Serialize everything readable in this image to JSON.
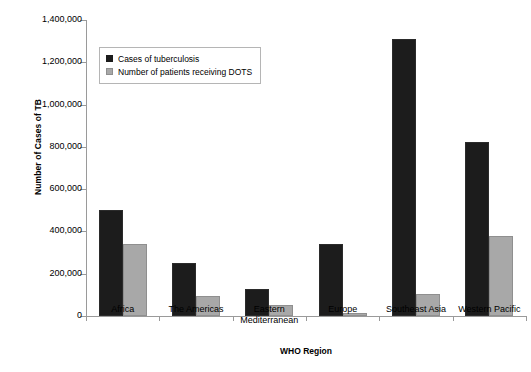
{
  "chart_data": {
    "type": "bar",
    "title": "",
    "xlabel": "WHO Region",
    "ylabel": "Number of Cases of TB",
    "ylim": [
      0,
      1400000
    ],
    "ytick_labels": [
      "1,400,000",
      "1,200,000",
      "1,000,000",
      "800,000",
      "600,000",
      "400,000",
      "200,000",
      "0"
    ],
    "ytick_values": [
      1400000,
      1200000,
      1000000,
      800000,
      600000,
      400000,
      200000,
      0
    ],
    "grid": false,
    "legend_position": "upper-left-inside",
    "categories": [
      "Africa",
      "The Americas",
      "Eastern Mediterranean",
      "Europe",
      "Southeast Asia",
      "Western Pacific"
    ],
    "series": [
      {
        "name": "Cases of tuberculosis",
        "color": "#1c1c1c",
        "values": [
          500000,
          250000,
          130000,
          340000,
          1310000,
          825000
        ]
      },
      {
        "name": "Number of patients receiving DOTS",
        "color": "#a8a8a8",
        "values": [
          340000,
          95000,
          50000,
          15000,
          105000,
          380000
        ]
      }
    ]
  },
  "legend": {
    "items": [
      {
        "label": "Cases of tuberculosis",
        "swatch": "dark-square-swatch"
      },
      {
        "label": "Number of patients receiving DOTS",
        "swatch": "gray-square-swatch"
      }
    ]
  },
  "axes": {
    "y_title": "Number of Cases of TB",
    "x_title": "WHO Region"
  }
}
